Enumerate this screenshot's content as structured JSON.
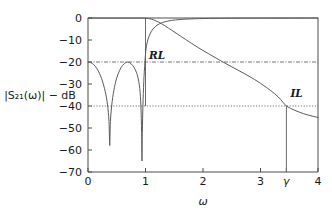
{
  "chart_data": {
    "type": "line",
    "title": "",
    "xlabel": "ω",
    "ylabel": "|S₂₁(ω)| − dB",
    "xlim": [
      0,
      4
    ],
    "ylim": [
      -70,
      0
    ],
    "grid": false,
    "legend": false,
    "xticks": [
      0,
      1,
      2,
      3,
      3.45,
      4
    ],
    "xtick_labels": [
      "0",
      "1",
      "2",
      "3",
      "γ",
      "4"
    ],
    "yticks": [
      0,
      -10,
      -20,
      -30,
      -40,
      -50,
      -60,
      -70
    ],
    "ytick_labels": [
      "0",
      "−10",
      "−20",
      "−30",
      "−40",
      "−50",
      "−60",
      "−70"
    ],
    "series": [
      {
        "name": "reflection",
        "comment": "equiripple reflection response |S11| with two transmission-zero nulls in passband, rising to 0 dB in stopband",
        "points": [
          [
            0.0,
            -20.0
          ],
          [
            0.05,
            -20.3
          ],
          [
            0.1,
            -21.2
          ],
          [
            0.15,
            -22.8
          ],
          [
            0.2,
            -25.2
          ],
          [
            0.25,
            -28.6
          ],
          [
            0.3,
            -33.5
          ],
          [
            0.34,
            -39.5
          ],
          [
            0.365,
            -47.0
          ],
          [
            0.378,
            -58.0
          ],
          [
            0.39,
            -47.0
          ],
          [
            0.42,
            -38.0
          ],
          [
            0.46,
            -31.5
          ],
          [
            0.5,
            -27.2
          ],
          [
            0.55,
            -23.8
          ],
          [
            0.6,
            -21.6
          ],
          [
            0.66,
            -20.2
          ],
          [
            0.7,
            -20.1
          ],
          [
            0.75,
            -20.8
          ],
          [
            0.8,
            -22.4
          ],
          [
            0.84,
            -24.6
          ],
          [
            0.87,
            -27.2
          ],
          [
            0.9,
            -32.0
          ],
          [
            0.92,
            -40.0
          ],
          [
            0.932,
            -52.0
          ],
          [
            0.938,
            -65.0
          ],
          [
            0.945,
            -52.0
          ],
          [
            0.955,
            -40.0
          ],
          [
            0.97,
            -29.0
          ],
          [
            0.99,
            -20.0
          ],
          [
            1.01,
            -14.0
          ],
          [
            1.04,
            -10.0
          ],
          [
            1.08,
            -7.2
          ],
          [
            1.13,
            -5.0
          ],
          [
            1.2,
            -3.3
          ],
          [
            1.3,
            -2.0
          ],
          [
            1.45,
            -1.1
          ],
          [
            1.6,
            -0.7
          ],
          [
            1.8,
            -0.4
          ],
          [
            2.1,
            -0.2
          ],
          [
            2.5,
            -0.1
          ],
          [
            3.0,
            -0.05
          ],
          [
            3.5,
            -0.03
          ],
          [
            4.0,
            -0.02
          ]
        ]
      },
      {
        "name": "transmission",
        "comment": "|S21| passband flat near 0 dB, rolling off monotonically; crosses −40 dB at ω = γ",
        "points": [
          [
            0.0,
            -0.04
          ],
          [
            0.3,
            -0.05
          ],
          [
            0.6,
            -0.05
          ],
          [
            0.85,
            -0.06
          ],
          [
            1.0,
            -0.08
          ],
          [
            1.1,
            -0.5
          ],
          [
            1.18,
            -1.3
          ],
          [
            1.28,
            -2.6
          ],
          [
            1.4,
            -4.6
          ],
          [
            1.55,
            -7.2
          ],
          [
            1.7,
            -9.8
          ],
          [
            1.9,
            -13.2
          ],
          [
            2.1,
            -16.3
          ],
          [
            2.3,
            -19.3
          ],
          [
            2.5,
            -22.2
          ],
          [
            2.7,
            -25.0
          ],
          [
            2.9,
            -28.0
          ],
          [
            3.1,
            -31.5
          ],
          [
            3.25,
            -34.5
          ],
          [
            3.35,
            -37.0
          ],
          [
            3.45,
            -40.0
          ],
          [
            3.6,
            -42.0
          ],
          [
            3.75,
            -43.5
          ],
          [
            3.9,
            -44.6
          ],
          [
            4.0,
            -45.2
          ]
        ]
      }
    ],
    "reference_lines": [
      {
        "name": "RL",
        "value": -20,
        "label": "RL",
        "style": "dash-dot",
        "orientation": "horizontal"
      },
      {
        "name": "IL",
        "value": -40,
        "label": "IL",
        "style": "dotted",
        "orientation": "horizontal"
      }
    ],
    "marker_lines": [
      {
        "name": "omega-1-marker",
        "x": 1.0,
        "from_db": -40,
        "to_db": 0
      },
      {
        "name": "gamma-marker",
        "x": 3.45,
        "from_db": -70,
        "to_db": -40
      }
    ],
    "annotations": [
      {
        "name": "RL",
        "text": "RL",
        "x": 1.06,
        "y": -18.5
      },
      {
        "name": "IL",
        "text": "IL",
        "x": 3.52,
        "y": -36.0
      }
    ]
  },
  "colors": {
    "curve": "#5a5a5a",
    "axis": "#4d4d4d",
    "reference": "#777777",
    "text": "#1a1a1a",
    "background": "#ffffff"
  }
}
